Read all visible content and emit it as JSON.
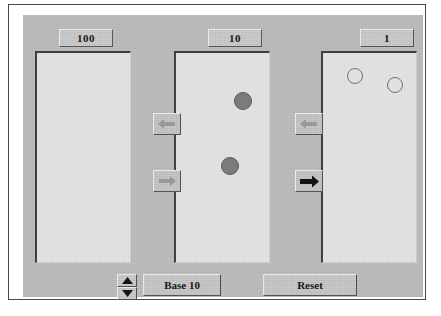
{
  "app": {
    "title": "Base Blocks Place Value",
    "background_color": "#bcbcbc",
    "panel_color": "#e8e8e6"
  },
  "columns": [
    {
      "name": "hundreds",
      "place_label": "100",
      "counters": [],
      "counter_count": 0,
      "counter_style": "none"
    },
    {
      "name": "tens",
      "place_label": "10",
      "counter_count": 2,
      "counter_style": "filled",
      "counters": [
        {
          "x": 67,
          "y": 48,
          "r": 9,
          "style": "filled",
          "color": "#7b7b7b"
        },
        {
          "x": 54,
          "y": 113,
          "r": 9,
          "style": "filled",
          "color": "#7b7b7b"
        }
      ]
    },
    {
      "name": "ones",
      "place_label": "1",
      "counter_count": 2,
      "counter_style": "hollow",
      "counters": [
        {
          "x": 32,
          "y": 23,
          "r": 8,
          "style": "hollow",
          "color": "#6f6f6f"
        },
        {
          "x": 72,
          "y": 32,
          "r": 8,
          "style": "hollow",
          "color": "#6f6f6f"
        }
      ]
    }
  ],
  "transfer_controls": [
    {
      "name": "hundreds-to-tens-left",
      "icon": "arrow-left-icon",
      "direction": "left",
      "state": "disabled"
    },
    {
      "name": "tens-to-hundreds-right",
      "icon": "arrow-right-icon",
      "direction": "right",
      "state": "disabled"
    },
    {
      "name": "tens-to-ones-left",
      "icon": "arrow-left-icon",
      "direction": "left",
      "state": "disabled"
    },
    {
      "name": "ones-to-tens-right",
      "icon": "arrow-right-icon",
      "direction": "right",
      "state": "enabled"
    }
  ],
  "bottom_bar": {
    "spinner": {
      "up_icon": "triangle-up-icon",
      "down_icon": "triangle-down-icon"
    },
    "base_label": "Base 10",
    "reset_label": "Reset"
  },
  "colors": {
    "panel_gray": "#bcbcbc",
    "column_white": "#e8e8e6",
    "button_face": "#c6c6c6",
    "counter_fill": "#7b7b7b",
    "counter_outline": "#6f6f6f",
    "arrow_enabled": "#0d0d0d",
    "arrow_disabled": "#9a9a9a",
    "text": "#111111"
  }
}
